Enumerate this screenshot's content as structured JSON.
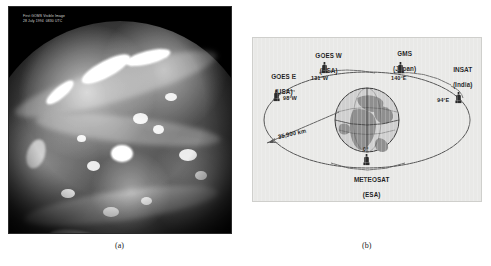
{
  "figure": {
    "panel_a": {
      "caption": "(a)",
      "overlay_text_line1": "First GOMS Visible Image",
      "overlay_text_line2": "28 July 1994  0830 UTC",
      "subject": "full-disk visible satellite image of Earth"
    },
    "panel_b": {
      "caption": "(b)",
      "orbit_distance_label": "35,900 km",
      "earth_prime_meridian_label": "0°",
      "satellites": [
        {
          "name": "GOES E",
          "operator": "(USA)",
          "longitude": "98°W"
        },
        {
          "name": "GOES W",
          "operator": "(USA)",
          "longitude": "131°W"
        },
        {
          "name": "GMS",
          "operator": "(Japan)",
          "longitude": "140°E"
        },
        {
          "name": "INSAT",
          "operator": "(India)",
          "longitude": "94°E"
        },
        {
          "name": "METEOSAT",
          "operator": "(ESA)",
          "longitude": "0°"
        }
      ]
    }
  },
  "colors": {
    "panel_b_background": "#e9e9e7",
    "orbit_line": "#555555",
    "earth_land": "#8f8f8f",
    "earth_ocean": "#cfcfcf",
    "satellite_body": "#2a2a2a",
    "text": "#1d1d1d"
  }
}
